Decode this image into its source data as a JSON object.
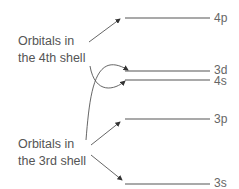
{
  "groups": [
    {
      "label_line1": "Orbitals in",
      "label_line2": "the 4th shell"
    },
    {
      "label_line1": "Orbitals in",
      "label_line2": "the 3rd shell"
    }
  ],
  "levels": [
    {
      "name": "4p",
      "y": 18
    },
    {
      "name": "3d",
      "y": 71
    },
    {
      "name": "4s",
      "y": 80
    },
    {
      "name": "3p",
      "y": 119
    },
    {
      "name": "3s",
      "y": 184
    }
  ],
  "colors": {
    "line": "#555555",
    "text": "#555555"
  }
}
